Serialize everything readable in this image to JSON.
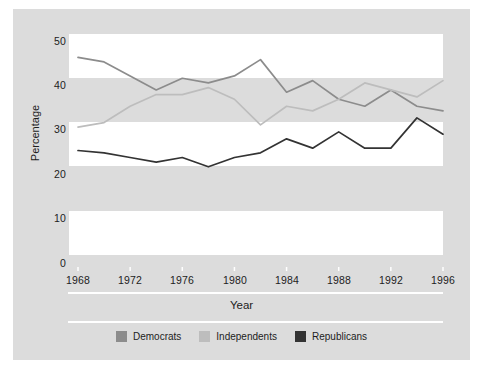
{
  "chart_data": {
    "type": "line",
    "title": "",
    "xlabel": "Year",
    "ylabel": "Percentage",
    "xlim": [
      1968,
      1996
    ],
    "ylim": [
      0,
      50
    ],
    "xticks": [
      "1968",
      "1972",
      "1976",
      "1980",
      "1984",
      "1988",
      "1992",
      "1996"
    ],
    "yticks": [
      "0",
      "10",
      "20",
      "30",
      "40",
      "50"
    ],
    "grid": false,
    "legend_position": "bottom",
    "x": [
      1968,
      1970,
      1972,
      1974,
      1976,
      1978,
      1980,
      1982,
      1984,
      1986,
      1988,
      1990,
      1992,
      1994,
      1996
    ],
    "series": [
      {
        "name": "Democrats",
        "color": "#8c8c8c",
        "values": [
          45.0,
          44.0,
          41.0,
          38.0,
          40.5,
          39.5,
          41.0,
          44.5,
          37.5,
          40.0,
          36.0,
          34.5,
          38.0,
          34.5,
          33.5
        ]
      },
      {
        "name": "Independents",
        "color": "#bdbdbd",
        "values": [
          30.0,
          31.0,
          34.5,
          37.0,
          37.0,
          38.5,
          36.0,
          30.5,
          34.5,
          33.5,
          36.0,
          39.5,
          38.0,
          36.5,
          40.0
        ]
      },
      {
        "name": "Republicans",
        "color": "#333333",
        "values": [
          25.0,
          24.5,
          23.5,
          22.5,
          23.5,
          21.5,
          23.5,
          24.5,
          27.5,
          25.5,
          29.0,
          25.5,
          25.5,
          32.0,
          28.5
        ]
      }
    ]
  },
  "legend": {
    "items": [
      {
        "label": "Democrats",
        "color": "#8c8c8c"
      },
      {
        "label": "Independents",
        "color": "#bdbdbd"
      },
      {
        "label": "Republicans",
        "color": "#333333"
      }
    ]
  },
  "axes": {
    "x_title": "Year",
    "y_title": "Percentage"
  },
  "colors": {
    "figure_background": "#dcdcdc",
    "band": "#ffffff",
    "text": "#1d1d1d"
  }
}
